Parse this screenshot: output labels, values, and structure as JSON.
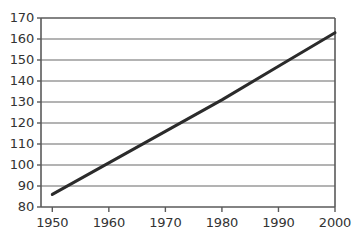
{
  "chart_data": {
    "type": "line",
    "title": "",
    "subtitle": "",
    "xlabel": "",
    "ylabel": "",
    "xlim": [
      1948,
      2000
    ],
    "ylim": [
      80,
      170
    ],
    "xticks": [
      1950,
      1960,
      1970,
      1980,
      1990,
      2000
    ],
    "xtick_labels": [
      "1950",
      "1960",
      "1970",
      "1980",
      "1990",
      "2000"
    ],
    "yticks": [
      80,
      90,
      100,
      110,
      120,
      130,
      140,
      150,
      160,
      170
    ],
    "ytick_labels": [
      "80",
      "90",
      "100",
      "110",
      "120",
      "130",
      "140",
      "150",
      "160",
      "170"
    ],
    "grid": "horizontal",
    "legend": "none",
    "series": [
      {
        "name": "trend",
        "color": "#2b2b2b",
        "x": [
          1950,
          1960,
          1970,
          1980,
          1990,
          2000
        ],
        "values": [
          86,
          101,
          116,
          131,
          147,
          163
        ]
      }
    ],
    "annotations": []
  },
  "style": {
    "axis_color": "#5a5a5a",
    "grid_color": "#9a9a9a",
    "tick_color": "#5a5a5a",
    "label_color": "#333333",
    "background": "#ffffff",
    "line_color": "#2b2b2b",
    "line_width": 3
  }
}
